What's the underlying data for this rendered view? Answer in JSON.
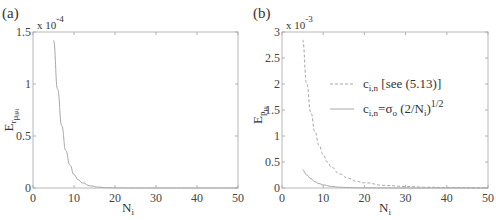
{
  "chart_data": [
    {
      "panel": "(a)",
      "type": "line",
      "title": "",
      "xlabel": "N_i",
      "ylabel": "E_{r_{μ_i μ_i}}",
      "y_scale_label": "x 10^-4",
      "y_multiplier": 0.0001,
      "xlim": [
        0,
        50
      ],
      "ylim": [
        0,
        1.5
      ],
      "xticks": [
        0,
        10,
        20,
        30,
        40,
        50
      ],
      "yticks": [
        0,
        0.5,
        1,
        1.5
      ],
      "grid": false,
      "legend": null,
      "series": [
        {
          "name": "E",
          "style": "solid",
          "x": [
            5,
            6,
            7,
            8,
            9,
            10,
            11,
            12,
            14,
            16,
            18,
            20,
            25,
            30,
            40,
            50
          ],
          "values": [
            1.42,
            0.95,
            0.6,
            0.36,
            0.22,
            0.13,
            0.08,
            0.05,
            0.02,
            0.008,
            0.003,
            0.001,
            0,
            0,
            0,
            0
          ]
        }
      ]
    },
    {
      "panel": "(b)",
      "type": "line",
      "title": "",
      "xlabel": "N_i",
      "ylabel": "E_{p_{μ_i}}",
      "y_scale_label": "x 10^-3",
      "y_multiplier": 0.001,
      "xlim": [
        0,
        50
      ],
      "ylim": [
        0,
        3
      ],
      "xticks": [
        0,
        10,
        20,
        30,
        40,
        50
      ],
      "yticks": [
        0,
        0.5,
        1,
        1.5,
        2,
        2.5,
        3
      ],
      "grid": false,
      "legend_position": "upper right (inside)",
      "series": [
        {
          "name": "c_{i,n} [see (5.13)]",
          "style": "dashed",
          "x": [
            5,
            6,
            7,
            8,
            9,
            10,
            11,
            12,
            14,
            16,
            18,
            20,
            25,
            30,
            35,
            40,
            50
          ],
          "values": [
            2.85,
            2.0,
            1.45,
            1.08,
            0.82,
            0.64,
            0.5,
            0.4,
            0.27,
            0.19,
            0.13,
            0.1,
            0.05,
            0.03,
            0.015,
            0.008,
            0.003
          ]
        },
        {
          "name": "c_{i,n}=σ_o (2/N_i)^{1/2}",
          "style": "solid",
          "x": [
            5,
            6,
            7,
            8,
            9,
            10,
            12,
            14,
            16,
            18,
            20,
            30,
            50
          ],
          "values": [
            0.35,
            0.25,
            0.18,
            0.12,
            0.085,
            0.06,
            0.03,
            0.015,
            0.008,
            0.004,
            0.002,
            0,
            0
          ]
        }
      ]
    }
  ],
  "labels": {
    "panel_a": "(a)",
    "panel_b": "(b)",
    "scale_a_base": "x 10",
    "scale_a_exp": "-4",
    "scale_b_base": "x 10",
    "scale_b_exp": "-3",
    "xlabel_main": "N",
    "xlabel_sub": "i",
    "ylabel_a_main": "E",
    "ylabel_a_sub": "r",
    "ylabel_a_subsub": "μ",
    "ylabel_b_main": "E",
    "ylabel_b_sub": "p",
    "ylabel_b_subsub": "μ",
    "legend_1_main": "c",
    "legend_1_sub": "i,n",
    "legend_1_rest": " [see (5.13)]",
    "legend_2_main": "c",
    "legend_2_sub": "i,n",
    "legend_2_rest": "=σ",
    "legend_2_sub2": "o",
    "legend_2_rest2": " (2/N",
    "legend_2_sub3": "i",
    "legend_2_rest3": ")",
    "legend_2_exp": "1/2"
  },
  "colors": {
    "axis": "#b0b0b0",
    "curve": "#a8a8a8",
    "text": "#333333"
  }
}
